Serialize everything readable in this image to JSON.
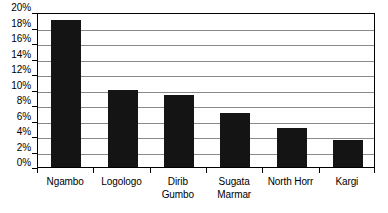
{
  "chart_data": {
    "type": "bar",
    "title": "",
    "subtitle": "",
    "xlabel": "",
    "ylabel": "",
    "categories": [
      "Ngambo",
      "Logologo",
      "Dirib\nGumbo",
      "Sugata\nMarmar",
      "North Horr",
      "Kargi"
    ],
    "values": [
      19.0,
      10.0,
      9.3,
      7.0,
      5.0,
      3.5
    ],
    "series": [
      {
        "name": "",
        "values": [
          19.0,
          10.0,
          9.3,
          7.0,
          5.0,
          3.5
        ]
      }
    ],
    "ylim": [
      0,
      20
    ],
    "ytick_values": [
      0,
      2,
      4,
      6,
      8,
      10,
      12,
      14,
      16,
      18,
      20
    ],
    "ytick_labels": [
      "0%",
      "2%",
      "4%",
      "6%",
      "8%",
      "10%",
      "12%",
      "14%",
      "16%",
      "18%",
      "20%"
    ],
    "grid": true,
    "grid_axis": "y",
    "legend": false,
    "legend_position": "none",
    "bar_color": "#141414",
    "gridline_color": "#8a8a8a",
    "axis_color": "#000000",
    "background_color": "#ffffff",
    "annotations": []
  }
}
